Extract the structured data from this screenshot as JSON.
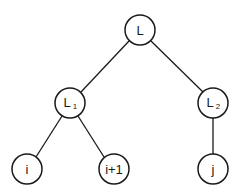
{
  "diagram": {
    "type": "tree",
    "nodes": [
      {
        "id": "L",
        "label": "L",
        "sub": "",
        "x": 140,
        "y": 30,
        "r": 15
      },
      {
        "id": "L1",
        "label": "L",
        "sub": "1",
        "x": 70,
        "y": 103,
        "r": 15
      },
      {
        "id": "L2",
        "label": "L",
        "sub": "2",
        "x": 213,
        "y": 103,
        "r": 15
      },
      {
        "id": "i",
        "label": "i",
        "sub": "",
        "x": 27,
        "y": 169,
        "r": 15
      },
      {
        "id": "i1",
        "label": "i+1",
        "sub": "",
        "x": 114,
        "y": 169,
        "r": 15
      },
      {
        "id": "j",
        "label": "j",
        "sub": "",
        "x": 213,
        "y": 169,
        "r": 15
      }
    ],
    "edges": [
      {
        "from": "L",
        "to": "L1"
      },
      {
        "from": "L",
        "to": "L2"
      },
      {
        "from": "L1",
        "to": "i"
      },
      {
        "from": "L1",
        "to": "i1"
      },
      {
        "from": "L2",
        "to": "j"
      }
    ]
  }
}
